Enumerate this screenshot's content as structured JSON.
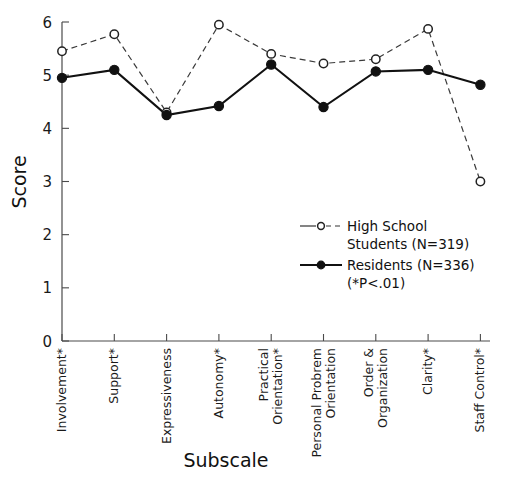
{
  "chart_data": {
    "type": "line",
    "title": "",
    "xlabel": "Subscale",
    "ylabel": "Score",
    "ylim": [
      0,
      6
    ],
    "yticks": [
      0,
      1,
      2,
      3,
      4,
      5,
      6
    ],
    "grid": false,
    "legend_position": "inside-right-middle",
    "categories": [
      "Involvement*",
      "Support*",
      "Expressiveness",
      "Autonomy*",
      "Practical Orientation*",
      "Personal Probrem Orientation",
      "Order & Organization",
      "Clarity*",
      "Staff Control*"
    ],
    "category_lines": [
      [
        "Involvement*"
      ],
      [
        "Support*"
      ],
      [
        "Expressiveness"
      ],
      [
        "Autonomy*"
      ],
      [
        "Practical",
        "Orientation*"
      ],
      [
        "Personal Probrem",
        "Orientation"
      ],
      [
        "Order &",
        "Organization"
      ],
      [
        "Clarity*"
      ],
      [
        "Staff Control*"
      ]
    ],
    "series": [
      {
        "name": "High School Students",
        "n": 319,
        "marker": "open-circle",
        "linestyle": "dashed",
        "color": "#333333",
        "values": [
          5.45,
          5.77,
          4.3,
          5.95,
          5.4,
          5.22,
          5.3,
          5.87,
          3.0
        ]
      },
      {
        "name": "Residents",
        "n": 336,
        "marker": "filled-circle",
        "linestyle": "solid",
        "color": "#111111",
        "values": [
          4.95,
          5.1,
          4.25,
          4.42,
          5.2,
          4.4,
          5.07,
          5.1,
          4.82
        ]
      }
    ],
    "annotations": [
      "(*P<.01)"
    ]
  },
  "legend": {
    "entries": [
      {
        "line1": "High School",
        "line2": "Students  (N=319)"
      },
      {
        "line1": "Residents  (N=336)",
        "line2": "(*P<.01)"
      }
    ]
  },
  "axes": {
    "y_title": "Score",
    "x_title": "Subscale",
    "y_tick_labels": [
      "6",
      "5",
      "4",
      "3",
      "2",
      "1",
      "0"
    ]
  }
}
